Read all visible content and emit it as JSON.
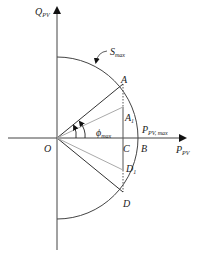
{
  "diagram": {
    "axes": {
      "y_label": "Q",
      "y_label_sub": "PV",
      "x_label": "P",
      "x_label_sub": "PV"
    },
    "arc_label": {
      "main": "S",
      "sub": "max"
    },
    "points": {
      "origin": "O",
      "A": "A",
      "A1": "A",
      "A1_sub": "1",
      "C": "C",
      "B": "B",
      "D1": "D",
      "D1_sub": "1",
      "D": "D"
    },
    "p_max_label": {
      "main": "P",
      "sub": "PV, max"
    },
    "angle_label": {
      "main": "ϕ",
      "sub": "max"
    },
    "colors": {
      "line": "#333333",
      "light_line": "#aaaaaa"
    }
  }
}
